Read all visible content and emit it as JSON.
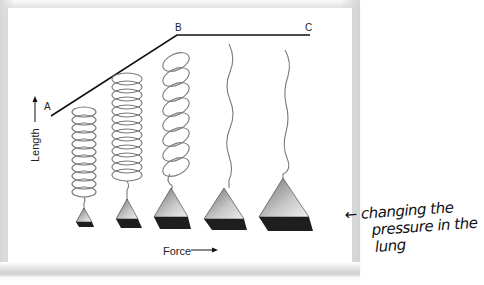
{
  "diagram": {
    "curve_points": [
      {
        "label": "A",
        "x": 51,
        "y": 116
      },
      {
        "label": "B",
        "x": 177,
        "y": 35
      },
      {
        "label": "C",
        "x": 310,
        "y": 35
      }
    ],
    "axes": {
      "y_label": "Length",
      "y_arrow": "up-arrow",
      "x_label": "Force",
      "x_arrow": "right-arrow"
    },
    "elements": [
      {
        "type": "coil",
        "index": 1,
        "coil_turns": 11,
        "weight_size": "smallest"
      },
      {
        "type": "coil",
        "index": 2,
        "coil_turns": 13,
        "weight_size": "small"
      },
      {
        "type": "coil",
        "index": 3,
        "coil_turns": 8,
        "weight_size": "medium"
      },
      {
        "type": "straightened-wire",
        "index": 4,
        "weight_size": "large"
      },
      {
        "type": "straightened-wire",
        "index": 5,
        "weight_size": "largest"
      }
    ],
    "colors": {
      "curve": "#111111",
      "coil": "#7a7a7a",
      "weight_top": "#9a9a9a",
      "weight_base": "#1e1e1e",
      "frame_shadow": "#d4d4d4"
    }
  },
  "annotation": {
    "arrow": "left-arrow",
    "line1": "← changing the",
    "line2": "pressure in the",
    "line3": "lung"
  }
}
